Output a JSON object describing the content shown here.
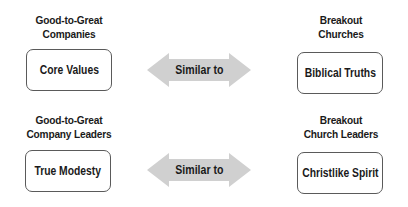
{
  "rows": [
    {
      "left": {
        "heading": [
          "Good-to-Great",
          "Companies"
        ],
        "box": "Core Values"
      },
      "relation": "Similar to",
      "right": {
        "heading": [
          "Breakout",
          "Churches"
        ],
        "box": "Biblical Truths"
      }
    },
    {
      "left": {
        "heading": [
          "Good-to-Great",
          "Company Leaders"
        ],
        "box": "True Modesty"
      },
      "relation": "Similar to",
      "right": {
        "heading": [
          "Breakout",
          "Church Leaders"
        ],
        "box": "Christlike Spirit"
      }
    }
  ],
  "colors": {
    "arrow_fill": "#d0d0d0",
    "box_border": "#5a5a5a",
    "text": "#1a1a1a"
  }
}
